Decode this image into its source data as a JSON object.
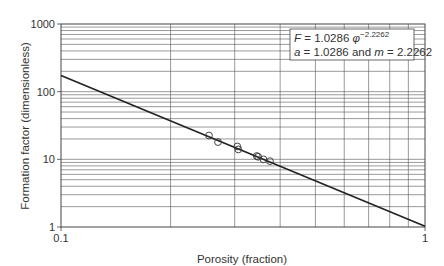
{
  "chart_data": {
    "type": "scatter",
    "title": "",
    "xlabel": "Porosity (fraction)",
    "ylabel": "Formation factor (dimensionless)",
    "xscale": "log",
    "yscale": "log",
    "xlim": [
      0.1,
      1
    ],
    "ylim": [
      1,
      1000
    ],
    "grid": true,
    "x_ticks": [
      "0.1",
      "1"
    ],
    "y_ticks": [
      "1",
      "10",
      "100",
      "1000"
    ],
    "series": [
      {
        "name": "Measured data",
        "marker": "open-circle",
        "points": [
          {
            "x": 0.255,
            "y": 22.5
          },
          {
            "x": 0.27,
            "y": 18.0
          },
          {
            "x": 0.305,
            "y": 15.5
          },
          {
            "x": 0.307,
            "y": 14.0
          },
          {
            "x": 0.345,
            "y": 11.2
          },
          {
            "x": 0.348,
            "y": 10.9
          },
          {
            "x": 0.36,
            "y": 10.0
          },
          {
            "x": 0.375,
            "y": 9.4
          }
        ]
      },
      {
        "name": "Fit: F = 1.0286 phi^-2.2262",
        "type": "line",
        "a": 1.0286,
        "m": 2.2262,
        "x_range": [
          0.1,
          1
        ]
      }
    ],
    "annotations": [
      {
        "line1_var": "F",
        "line1_text": " = 1.0286 ",
        "line1_phi": "φ",
        "line1_exp": "−2.2262"
      },
      {
        "line2_a": "a",
        "line2_mid": " = 1.0286 and ",
        "line2_m": "m",
        "line2_end": " = 2.2262"
      }
    ],
    "legend_position": "top-right"
  },
  "text": {
    "xlabel": "Porosity (fraction)",
    "ylabel": "Formation factor (dimensionless)",
    "y_ticks": [
      "1000",
      "100",
      "10",
      "1"
    ],
    "x_ticks": [
      "0.1",
      "1"
    ],
    "eq_F": "F",
    "eq_eq": " = 1.0286 ",
    "eq_phi": "φ",
    "eq_exp": "−2.2262",
    "eq2_a": "a",
    "eq2_mid": " = 1.0286 and ",
    "eq2_m": "m",
    "eq2_end": " = 2.2262"
  },
  "colors": {
    "grid": "#555555",
    "axis": "#333333",
    "line": "#222222",
    "marker": "#333333"
  }
}
